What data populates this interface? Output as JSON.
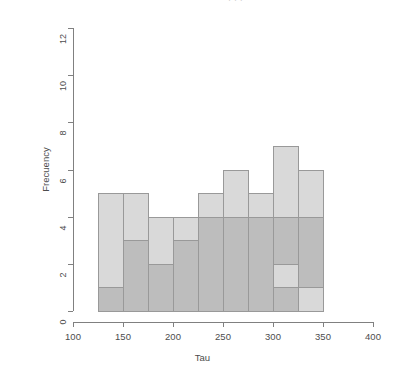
{
  "figure": {
    "clipped_top_text": "· ·  ·",
    "background_color": "#ffffff",
    "axis_color": "#808080",
    "text_color": "#4d4d4d"
  },
  "chart_data": {
    "type": "bar",
    "title": "",
    "subtitle": "",
    "xlabel": "Tau",
    "ylabel": "Frecuency",
    "xlim": [
      100,
      400
    ],
    "ylim": [
      0,
      12
    ],
    "xticks": [
      100,
      150,
      200,
      250,
      300,
      350,
      400
    ],
    "yticks": [
      0,
      2,
      4,
      6,
      8,
      10,
      12
    ],
    "grid": false,
    "legend": "none",
    "bin_width": 25,
    "bin_edges": [
      125,
      150,
      175,
      200,
      225,
      250,
      275,
      300,
      325,
      350
    ],
    "categories": [
      "125-150",
      "150-175",
      "175-200",
      "200-225",
      "225-250",
      "250-275",
      "275-300",
      "300-325",
      "325-350"
    ],
    "series": [
      {
        "name": "light-histogram",
        "color": "#d9d9d9",
        "border_color": "#999999",
        "values": [
          5,
          5,
          4,
          4,
          5,
          6,
          5,
          7,
          6
        ]
      },
      {
        "name": "dark-histogram",
        "color": "#bdbdbd",
        "border_color": "#999999",
        "values": [
          1,
          3,
          2,
          3,
          4,
          4,
          4,
          4,
          4
        ]
      }
    ],
    "tail_bins": {
      "categories": [
        "300-325",
        "325-350"
      ],
      "light_values": [
        2,
        1
      ],
      "dark_values": [
        1,
        0
      ]
    },
    "annotations": []
  }
}
